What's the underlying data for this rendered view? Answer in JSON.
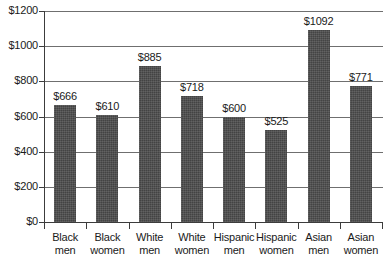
{
  "chart_data": {
    "type": "bar",
    "title": "",
    "subtitle": "",
    "xlabel": "",
    "ylabel": "",
    "categories": [
      "Black men",
      "Black women",
      "White men",
      "White women",
      "Hispanic men",
      "Hispanic women",
      "Asian men",
      "Asian women"
    ],
    "category_lines": [
      [
        "Black",
        "men"
      ],
      [
        "Black",
        "women"
      ],
      [
        "White",
        "men"
      ],
      [
        "White",
        "women"
      ],
      [
        "Hispanic",
        "men"
      ],
      [
        "Hispanic",
        "women"
      ],
      [
        "Asian",
        "men"
      ],
      [
        "Asian",
        "women"
      ]
    ],
    "values": [
      666,
      610,
      885,
      718,
      600,
      525,
      1092,
      771
    ],
    "value_labels": [
      "$666",
      "$610",
      "$885",
      "$718",
      "$600",
      "$525",
      "$1092",
      "$771"
    ],
    "ylim": [
      0,
      1200
    ],
    "ytick_values": [
      0,
      200,
      400,
      600,
      800,
      1000,
      1200
    ],
    "ytick_labels": [
      "$0",
      "$200",
      "$400",
      "$600",
      "$800",
      "$1000",
      "$1200"
    ],
    "grid": true,
    "grid_axis": "y",
    "legend": null,
    "legend_position": "none",
    "series": [
      {
        "name": "Median weekly earnings",
        "values": [
          666,
          610,
          885,
          718,
          600,
          525,
          1092,
          771
        ]
      }
    ],
    "colors": {
      "bar_fill": "#4b4b4b",
      "gridline": "#6f6f6f",
      "axis": "#3c3c3c",
      "text": "#1a1a1a",
      "background": "#ffffff"
    }
  }
}
